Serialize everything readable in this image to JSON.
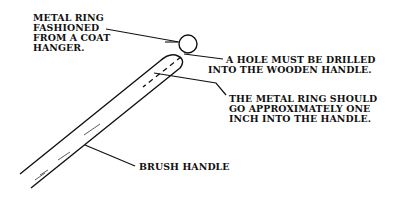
{
  "diagram": {
    "colors": {
      "ink": "#111111",
      "background": "#ffffff"
    },
    "callouts": [
      {
        "id": "metal-ring",
        "lines": [
          "METAL RING",
          "FASHIONED",
          "FROM A COAT",
          "HANGER."
        ]
      },
      {
        "id": "hole",
        "lines": [
          "A HOLE MUST BE DRILLED",
          "INTO THE WOODEN HANDLE."
        ]
      },
      {
        "id": "ring-depth",
        "lines": [
          "THE METAL RING SHOULD",
          "GO APPROXIMATELY ONE",
          "INCH INTO THE HANDLE."
        ]
      },
      {
        "id": "brush-handle",
        "lines": [
          "BRUSH HANDLE"
        ]
      }
    ]
  }
}
